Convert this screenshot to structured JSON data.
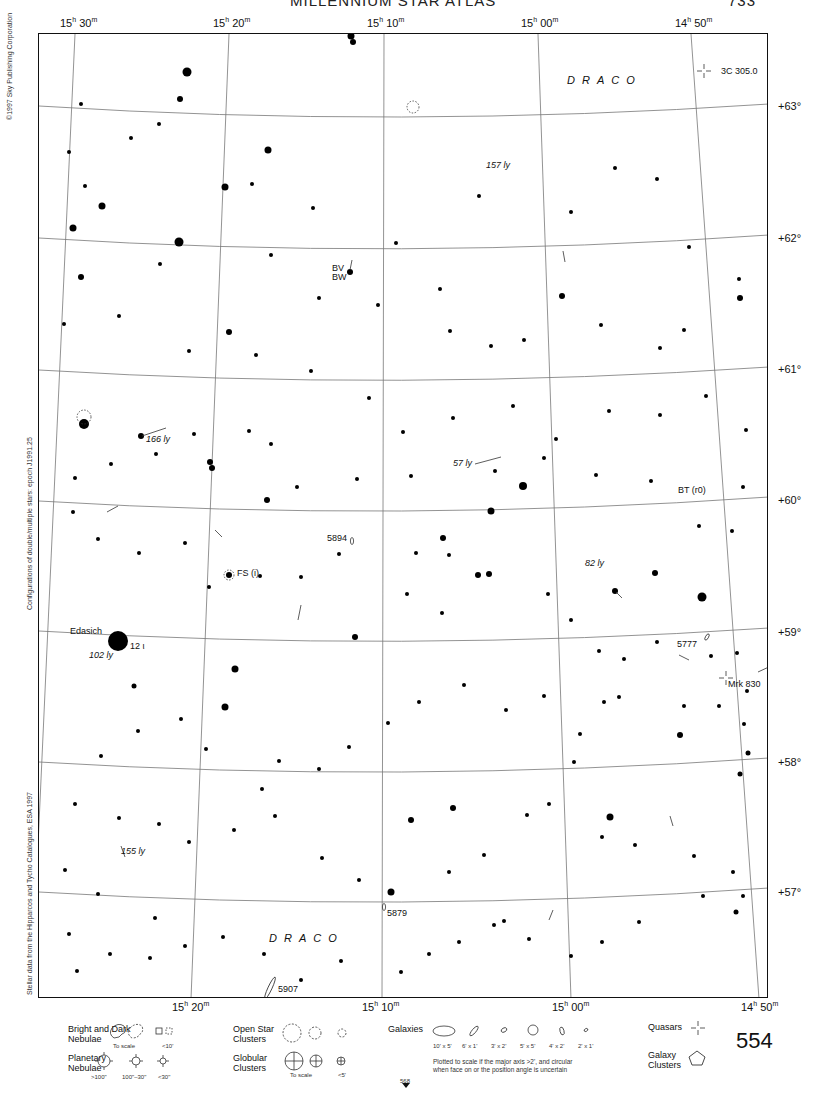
{
  "header": {
    "title_fragment": "MILLENNIUM STAR ATLAS",
    "page_fragment": "733"
  },
  "ra_labels_top": [
    {
      "h": "15",
      "m": "30",
      "x": 60
    },
    {
      "h": "15",
      "m": "20",
      "x": 213
    },
    {
      "h": "15",
      "m": "10",
      "x": 367
    },
    {
      "h": "15",
      "m": "00",
      "x": 521
    },
    {
      "h": "14",
      "m": "50",
      "x": 675
    }
  ],
  "ra_labels_bottom": [
    {
      "h": "15",
      "m": "20",
      "x": 172
    },
    {
      "h": "15",
      "m": "10",
      "x": 362
    },
    {
      "h": "15",
      "m": "00",
      "x": 552
    },
    {
      "h": "14",
      "m": "50",
      "x": 741
    }
  ],
  "dec_labels": [
    {
      "text": "+63°",
      "y": 100
    },
    {
      "text": "+62°",
      "y": 232
    },
    {
      "text": "+61°",
      "y": 363
    },
    {
      "text": "+60°",
      "y": 494
    },
    {
      "text": "+59°",
      "y": 626
    },
    {
      "text": "+58°",
      "y": 756
    },
    {
      "text": "+57°",
      "y": 886
    }
  ],
  "side_notes": {
    "copyright": "©1997 Sky Publishing Corporation",
    "configurations": "Configurations of double/multiple stars: epoch J1991.25",
    "stellar_data": "Stellar data from the Hipparcos and Tycho Catalogues, ESA 1997"
  },
  "constellations": [
    {
      "name": "DRACO",
      "x": 528,
      "y": 40
    },
    {
      "name": "DRACO",
      "x": 230,
      "y": 898
    }
  ],
  "objects": [
    {
      "label": "3C 305.0",
      "type": "quasar",
      "x": 682,
      "y": 32,
      "italic": false
    },
    {
      "label": "157 ly",
      "type": "distance",
      "x": 447,
      "y": 126,
      "italic": true
    },
    {
      "label": "BV",
      "type": "variable-star",
      "x": 293,
      "y": 229,
      "italic": false
    },
    {
      "label": "BW",
      "type": "variable-star",
      "x": 293,
      "y": 238,
      "italic": false
    },
    {
      "label": "166 ly",
      "type": "distance",
      "x": 107,
      "y": 400,
      "italic": true
    },
    {
      "label": "57 ly",
      "type": "distance",
      "x": 414,
      "y": 424,
      "italic": true
    },
    {
      "label": "BT (r0)",
      "type": "variable-star",
      "x": 639,
      "y": 451,
      "italic": false
    },
    {
      "label": "5894",
      "type": "galaxy",
      "x": 288,
      "y": 499,
      "italic": false
    },
    {
      "label": "FS (i)",
      "type": "variable-star",
      "x": 198,
      "y": 534,
      "italic": false
    },
    {
      "label": "82 ly",
      "type": "distance",
      "x": 546,
      "y": 524,
      "italic": true
    },
    {
      "label": "Edasich",
      "type": "star-name",
      "x": 31,
      "y": 592,
      "italic": false
    },
    {
      "label": "12 ι",
      "type": "bayer",
      "x": 91,
      "y": 607,
      "italic": false
    },
    {
      "label": "102 ly",
      "type": "distance",
      "x": 50,
      "y": 616,
      "italic": true
    },
    {
      "label": "5777",
      "type": "galaxy",
      "x": 638,
      "y": 605,
      "italic": false
    },
    {
      "label": "Mrk 830",
      "type": "quasar",
      "x": 689,
      "y": 645,
      "italic": false
    },
    {
      "label": "155 ly",
      "type": "distance",
      "x": 82,
      "y": 812,
      "italic": true
    },
    {
      "label": "5879",
      "type": "galaxy",
      "x": 348,
      "y": 874,
      "italic": false
    },
    {
      "label": "5907",
      "type": "galaxy",
      "x": 239,
      "y": 950,
      "italic": false
    }
  ],
  "legend": {
    "nebulae": {
      "title1": "Bright and Dark",
      "title2": "Nebulae",
      "scale": "To scale",
      "small": "<10'"
    },
    "planetary": {
      "title1": "Planetary",
      "title2": "Nebulae",
      "sizes": [
        ">100\"",
        "100\"–30\"",
        "<30\""
      ]
    },
    "open_clusters": {
      "title1": "Open Star",
      "title2": "Clusters"
    },
    "globular": {
      "title1": "Globular",
      "title2": "Clusters",
      "scale": "To scale",
      "small": "<5'"
    },
    "galaxies": {
      "title": "Galaxies",
      "sizes": [
        "10' x 5'",
        "6' x 1'",
        "3' x 2'",
        "5' x 5'",
        "4' x 2'",
        "2' x 1'"
      ],
      "note1": "Plotted to scale if the major axis >2', and circular",
      "note2": "when face on or the position angle is uncertain"
    },
    "quasars": "Quasars",
    "galaxy_clusters": {
      "title1": "Galaxy",
      "title2": "Clusters"
    },
    "adjacent_page": "568"
  },
  "page_number": "554"
}
